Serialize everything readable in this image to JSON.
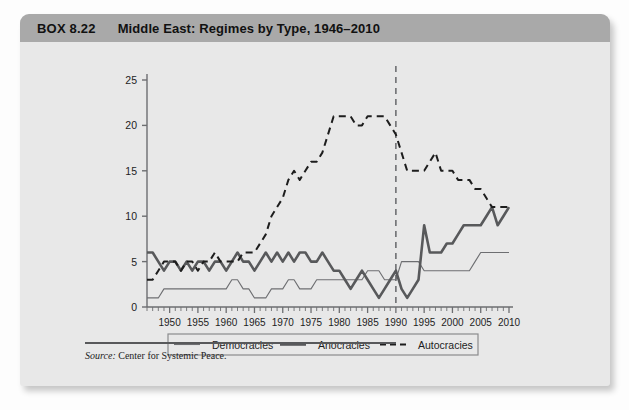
{
  "box": {
    "number": "BOX 8.22",
    "title": "Middle East: Regimes by Type, 1946–2010",
    "source_label": "Source:",
    "source_text": " Center for Systemic Peace."
  },
  "chart_data": {
    "type": "line",
    "title": "Middle East: Regimes by Type, 1946–2010",
    "xlabel": "",
    "ylabel": "",
    "xlim": [
      1946,
      2010
    ],
    "ylim": [
      0,
      25
    ],
    "yticks": [
      0,
      5,
      10,
      15,
      20,
      25
    ],
    "xticks": [
      1950,
      1955,
      1960,
      1965,
      1970,
      1975,
      1980,
      1985,
      1990,
      1995,
      2000,
      2005,
      2010
    ],
    "xtick_labels": [
      "1950",
      "1955",
      "1960",
      "1965",
      "1970",
      "1975",
      "1980",
      "1985",
      "1990",
      "1995",
      "2000",
      "2005",
      "2010"
    ],
    "ytick_labels": [
      "0",
      "5",
      "10",
      "15",
      "20",
      "25"
    ],
    "grid": false,
    "minor_tick_interval": 1,
    "legend_position": "bottom",
    "annotations": [
      {
        "type": "vline",
        "x": 1990,
        "style": "dashed",
        "color": "#6d6e71"
      }
    ],
    "x": [
      1946,
      1947,
      1948,
      1949,
      1950,
      1951,
      1952,
      1953,
      1954,
      1955,
      1956,
      1957,
      1958,
      1959,
      1960,
      1961,
      1962,
      1963,
      1964,
      1965,
      1966,
      1967,
      1968,
      1969,
      1970,
      1971,
      1972,
      1973,
      1974,
      1975,
      1976,
      1977,
      1978,
      1979,
      1980,
      1981,
      1982,
      1983,
      1984,
      1985,
      1986,
      1987,
      1988,
      1989,
      1990,
      1991,
      1992,
      1993,
      1994,
      1995,
      1996,
      1997,
      1998,
      1999,
      2000,
      2001,
      2002,
      2003,
      2004,
      2005,
      2006,
      2007,
      2008,
      2009,
      2010
    ],
    "series": [
      {
        "name": "Democracies",
        "style": "solid-thin",
        "color": "#6d6e71",
        "values": [
          1,
          1,
          1,
          2,
          2,
          2,
          2,
          2,
          2,
          2,
          2,
          2,
          2,
          2,
          2,
          3,
          3,
          2,
          2,
          1,
          1,
          1,
          2,
          2,
          2,
          3,
          3,
          2,
          2,
          2,
          3,
          3,
          3,
          3,
          3,
          3,
          3,
          3,
          3,
          4,
          4,
          4,
          3,
          3,
          3,
          5,
          5,
          5,
          5,
          4,
          4,
          4,
          4,
          4,
          4,
          4,
          4,
          4,
          5,
          6,
          6,
          6,
          6,
          6,
          6
        ]
      },
      {
        "name": "Anocracies",
        "style": "solid-thick",
        "color": "#58595b",
        "values": [
          6,
          6,
          5,
          4,
          5,
          5,
          4,
          5,
          4,
          5,
          5,
          4,
          5,
          5,
          4,
          5,
          6,
          5,
          5,
          4,
          5,
          6,
          5,
          6,
          5,
          6,
          5,
          6,
          6,
          5,
          5,
          6,
          5,
          4,
          4,
          3,
          2,
          3,
          4,
          3,
          2,
          1,
          2,
          3,
          4,
          2,
          1,
          2,
          3,
          9,
          6,
          6,
          6,
          7,
          7,
          8,
          9,
          9,
          9,
          9,
          10,
          11,
          9,
          10,
          11
        ]
      },
      {
        "name": "Autocracies",
        "style": "dashed",
        "color": "#1d1d1d",
        "values": [
          3,
          3,
          4,
          5,
          5,
          5,
          4,
          5,
          5,
          4,
          5,
          5,
          6,
          5,
          5,
          5,
          5,
          6,
          6,
          6,
          7,
          8,
          10,
          11,
          12,
          14,
          15,
          14,
          15,
          16,
          16,
          17,
          19,
          21,
          21,
          21,
          21,
          20,
          20,
          21,
          21,
          21,
          21,
          20,
          19,
          17,
          15,
          15,
          15,
          15,
          16,
          17,
          15,
          15,
          15,
          14,
          14,
          14,
          13,
          13,
          12,
          11,
          11,
          11,
          11
        ]
      }
    ],
    "legend": [
      {
        "label": "Democracies",
        "style": "solid-thin"
      },
      {
        "label": "Anocracies",
        "style": "solid-thick"
      },
      {
        "label": "Autocracies",
        "style": "dashed"
      }
    ]
  }
}
